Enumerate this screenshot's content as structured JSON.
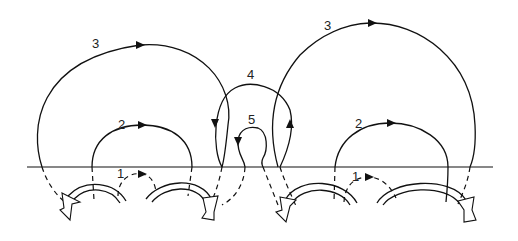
{
  "diagram": {
    "loop_labels": {
      "left_1": "1",
      "left_2": "2",
      "left_3": "3",
      "center_4": "4",
      "center_5": "5",
      "right_1": "1",
      "right_2": "2",
      "right_3": "3"
    },
    "colors": {
      "line": "#111111",
      "background": "#ffffff"
    }
  }
}
